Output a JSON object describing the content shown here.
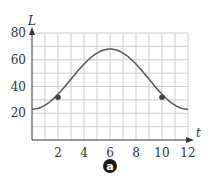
{
  "chart_data": {
    "type": "line",
    "title": "",
    "xlabel": "t",
    "ylabel": "L",
    "xlim": [
      0,
      12
    ],
    "ylim": [
      0,
      80
    ],
    "grid": true,
    "x_ticks": [
      2,
      4,
      6,
      8,
      10,
      12
    ],
    "y_ticks": [
      20,
      40,
      60,
      80
    ],
    "series": [
      {
        "name": "L(t)",
        "x": [
          0,
          1,
          2,
          3,
          4,
          5,
          6,
          7,
          8,
          9,
          10,
          11,
          12
        ],
        "values": [
          23,
          26,
          32,
          41,
          51,
          62,
          68,
          62,
          51,
          41,
          32,
          26,
          23
        ]
      }
    ],
    "marked_points": [
      {
        "x": 2,
        "y": 32
      },
      {
        "x": 10,
        "y": 32
      }
    ],
    "annotations": [
      "a"
    ]
  },
  "labels": {
    "x_axis": "t",
    "y_axis": "L",
    "x_ticks": [
      "2",
      "4",
      "6",
      "8",
      "10",
      "12"
    ],
    "y_ticks": [
      "20",
      "40",
      "60",
      "80"
    ],
    "badge": "a"
  },
  "colors": {
    "curve": "#555555",
    "grid": "#cccccc",
    "axis": "#333333",
    "badge": "#1a1a1a"
  }
}
